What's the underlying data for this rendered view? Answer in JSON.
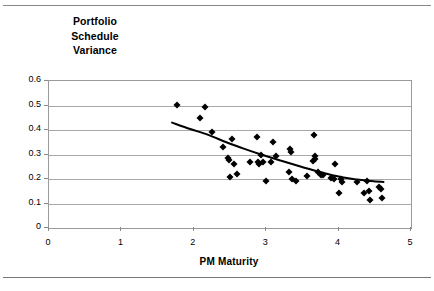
{
  "figure": {
    "title_lines": [
      "Portfolio",
      "Schedule",
      "Variance"
    ],
    "title_full": "Portfolio Schedule Variance"
  },
  "chart_data": {
    "type": "scatter",
    "xlabel": "PM Maturity",
    "ylabel": "",
    "xlim": [
      0,
      5
    ],
    "ylim": [
      0,
      0.6
    ],
    "xticks": [
      "0",
      "1",
      "2",
      "3",
      "4",
      "5"
    ],
    "yticks": [
      "0.6",
      "0.5",
      "0.4",
      "0.3",
      "0.2",
      "0.1",
      "0"
    ],
    "xtick_values": [
      0,
      1,
      2,
      3,
      4,
      5
    ],
    "ytick_values": [
      0.6,
      0.5,
      0.4,
      0.3,
      0.2,
      0.1,
      0
    ],
    "grid": "horizontal",
    "legend": "none",
    "marker": "filled-diamond",
    "marker_color": "#000000",
    "series": [
      {
        "name": "Portfolio Schedule Variance vs PM Maturity",
        "points": [
          [
            1.77,
            0.503
          ],
          [
            2.08,
            0.448
          ],
          [
            2.16,
            0.492
          ],
          [
            2.25,
            0.39
          ],
          [
            2.4,
            0.33
          ],
          [
            2.47,
            0.285
          ],
          [
            2.48,
            0.277
          ],
          [
            2.5,
            0.21
          ],
          [
            2.53,
            0.362
          ],
          [
            2.55,
            0.262
          ],
          [
            2.59,
            0.222
          ],
          [
            2.78,
            0.27
          ],
          [
            2.87,
            0.372
          ],
          [
            2.88,
            0.268
          ],
          [
            2.9,
            0.262
          ],
          [
            2.93,
            0.296
          ],
          [
            2.96,
            0.268
          ],
          [
            3.0,
            0.193
          ],
          [
            3.06,
            0.27
          ],
          [
            3.09,
            0.35
          ],
          [
            3.14,
            0.292
          ],
          [
            3.31,
            0.228
          ],
          [
            3.33,
            0.322
          ],
          [
            3.34,
            0.312
          ],
          [
            3.35,
            0.202
          ],
          [
            3.41,
            0.193
          ],
          [
            3.57,
            0.213
          ],
          [
            3.64,
            0.272
          ],
          [
            3.66,
            0.38
          ],
          [
            3.67,
            0.295
          ],
          [
            3.68,
            0.283
          ],
          [
            3.72,
            0.228
          ],
          [
            3.75,
            0.218
          ],
          [
            3.78,
            0.215
          ],
          [
            3.9,
            0.205
          ],
          [
            3.93,
            0.2
          ],
          [
            3.95,
            0.262
          ],
          [
            4.0,
            0.143
          ],
          [
            4.03,
            0.2
          ],
          [
            4.05,
            0.188
          ],
          [
            4.26,
            0.186
          ],
          [
            4.35,
            0.143
          ],
          [
            4.39,
            0.193
          ],
          [
            4.42,
            0.152
          ],
          [
            4.44,
            0.113
          ],
          [
            4.56,
            0.168
          ],
          [
            4.58,
            0.16
          ],
          [
            4.6,
            0.123
          ]
        ]
      }
    ],
    "trendline": {
      "name": "fitted trend",
      "color": "#000000",
      "points": [
        [
          1.7,
          0.43
        ],
        [
          1.95,
          0.404
        ],
        [
          2.2,
          0.38
        ],
        [
          2.45,
          0.35
        ],
        [
          2.7,
          0.323
        ],
        [
          2.95,
          0.298
        ],
        [
          3.2,
          0.275
        ],
        [
          3.45,
          0.253
        ],
        [
          3.7,
          0.232
        ],
        [
          3.95,
          0.213
        ],
        [
          4.2,
          0.2
        ],
        [
          4.45,
          0.192
        ],
        [
          4.62,
          0.188
        ]
      ]
    }
  }
}
